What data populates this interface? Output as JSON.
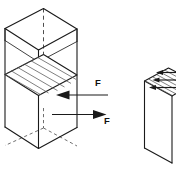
{
  "figure": {
    "title": "Shear force on a rectangular block",
    "background_color": "#ffffff",
    "line_color": "#1a1a1a",
    "hatch_color": "#555555",
    "hidden_line_color": "#3a3a3a",
    "width_px": 176,
    "height_px": 174,
    "labels": {
      "force_upper": "F",
      "force_lower": "F"
    },
    "annotations": [
      {
        "name": "force-arrow-upper",
        "label": "F",
        "direction": "left",
        "description": "Horizontal force arrow pointing left into the upper half of the block"
      },
      {
        "name": "force-arrow-lower",
        "label": "F",
        "direction": "right",
        "description": "Horizontal force arrow pointing right away from the lower half of the block"
      }
    ],
    "objects": [
      {
        "name": "block-left",
        "type": "rectangular-prism",
        "projection": "axonometric",
        "features": [
          "open-top",
          "hidden-edges-dashed",
          "hatched-shear-plane"
        ]
      },
      {
        "name": "block-right",
        "type": "rectangular-prism",
        "projection": "axonometric",
        "features": [
          "hatched-top-face",
          "small-shear-arrows",
          "cropped-at-edge"
        ]
      }
    ]
  }
}
